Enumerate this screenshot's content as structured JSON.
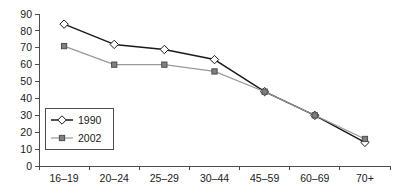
{
  "chart_data": {
    "type": "line",
    "title": "",
    "subtitle": "",
    "xlabel": "",
    "ylabel": "",
    "categories": [
      "16–19",
      "20–24",
      "25–29",
      "30–44",
      "45–59",
      "60–69",
      "70+"
    ],
    "ylim": [
      0,
      90
    ],
    "yticks": [
      0,
      10,
      20,
      30,
      40,
      50,
      60,
      70,
      80,
      90
    ],
    "ytick_labels": [
      "0",
      "10",
      "20",
      "30",
      "40",
      "50",
      "60",
      "70",
      "80",
      "90"
    ],
    "grid": false,
    "legend_position": "inside-lower-left",
    "series": [
      {
        "name": "1990",
        "values": [
          84,
          72,
          69,
          63,
          44,
          30,
          14
        ],
        "color": "#1a1a1a",
        "marker": "diamond",
        "marker_fill": "#ffffff",
        "marker_edge": "#1a1a1a"
      },
      {
        "name": "2002",
        "values": [
          71,
          60,
          60,
          56,
          44,
          30,
          16
        ],
        "color": "#999999",
        "marker": "square",
        "marker_fill": "#808080",
        "marker_edge": "#4d4d4d"
      }
    ],
    "legend": [
      "1990",
      "2002"
    ],
    "annotations": []
  },
  "colors": {
    "background": "#ffffff",
    "axis": "#4d4d4d",
    "text": "#1a1a1a",
    "series_1990": "#1a1a1a",
    "series_2002": "#999999"
  }
}
